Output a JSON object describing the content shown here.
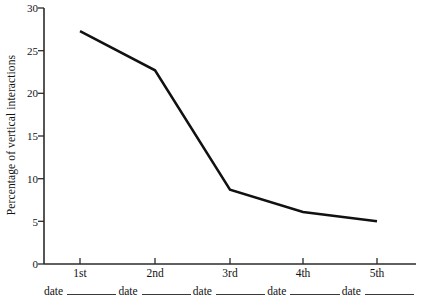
{
  "chart_data": {
    "type": "line",
    "title": "",
    "subtitle": "",
    "xlabel": "",
    "ylabel": "Percentage of vertical interactions",
    "categories": [
      "1st",
      "2nd",
      "3rd",
      "4th",
      "5th"
    ],
    "values": [
      27.3,
      22.7,
      8.7,
      6.1,
      5.0
    ],
    "series": [
      {
        "name": "Percentage of vertical interactions",
        "values": [
          27.3,
          22.7,
          8.7,
          6.1,
          5.0
        ]
      }
    ],
    "ylim": [
      0,
      30
    ],
    "yticks": [
      0,
      5,
      10,
      15,
      20,
      25,
      30
    ],
    "ytick_labels": [
      "0",
      "5",
      "10",
      "15",
      "20",
      "25",
      "30"
    ],
    "xtick_labels": [
      "1st",
      "2nd",
      "3rd",
      "4th",
      "5th"
    ],
    "grid": false,
    "legend": false,
    "legend_position": "none",
    "line_color": "#111111",
    "background_color": "#ffffff",
    "axis_color": "#2b2b2b",
    "annotations": []
  },
  "axis": {
    "y_label": "Percentage of vertical interactions"
  },
  "date_blanks": [
    {
      "label": "date"
    },
    {
      "label": "date"
    },
    {
      "label": "date"
    },
    {
      "label": "date"
    },
    {
      "label": "date"
    }
  ]
}
